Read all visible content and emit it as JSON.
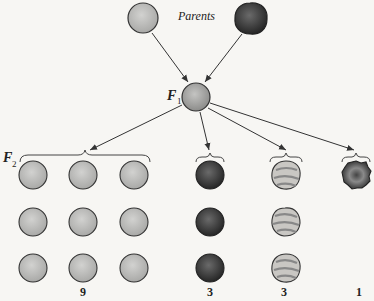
{
  "diagram": {
    "title_label": "Parents",
    "f1_label": "F",
    "f1_sub": "1",
    "f2_label": "F",
    "f2_sub": "2",
    "parents": [
      {
        "name": "light-smooth-seed",
        "type": "light"
      },
      {
        "name": "dark-rough-seed",
        "type": "dark"
      }
    ],
    "f2_groups": [
      {
        "name": "light-smooth",
        "count_label": "9",
        "rows": 3,
        "cols": 3,
        "type": "light"
      },
      {
        "name": "dark-smooth",
        "count_label": "3",
        "rows": 3,
        "cols": 1,
        "type": "dark"
      },
      {
        "name": "light-wrinkled",
        "count_label": "3",
        "rows": 3,
        "cols": 1,
        "type": "striped"
      },
      {
        "name": "dark-wrinkled",
        "count_label": "1",
        "rows": 1,
        "cols": 1,
        "type": "darkwrinkle"
      }
    ],
    "colors": {
      "light": "#bdbdbd",
      "dark": "#3c3c3c",
      "stroke": "#333333",
      "background": "#f7f6f3"
    }
  }
}
